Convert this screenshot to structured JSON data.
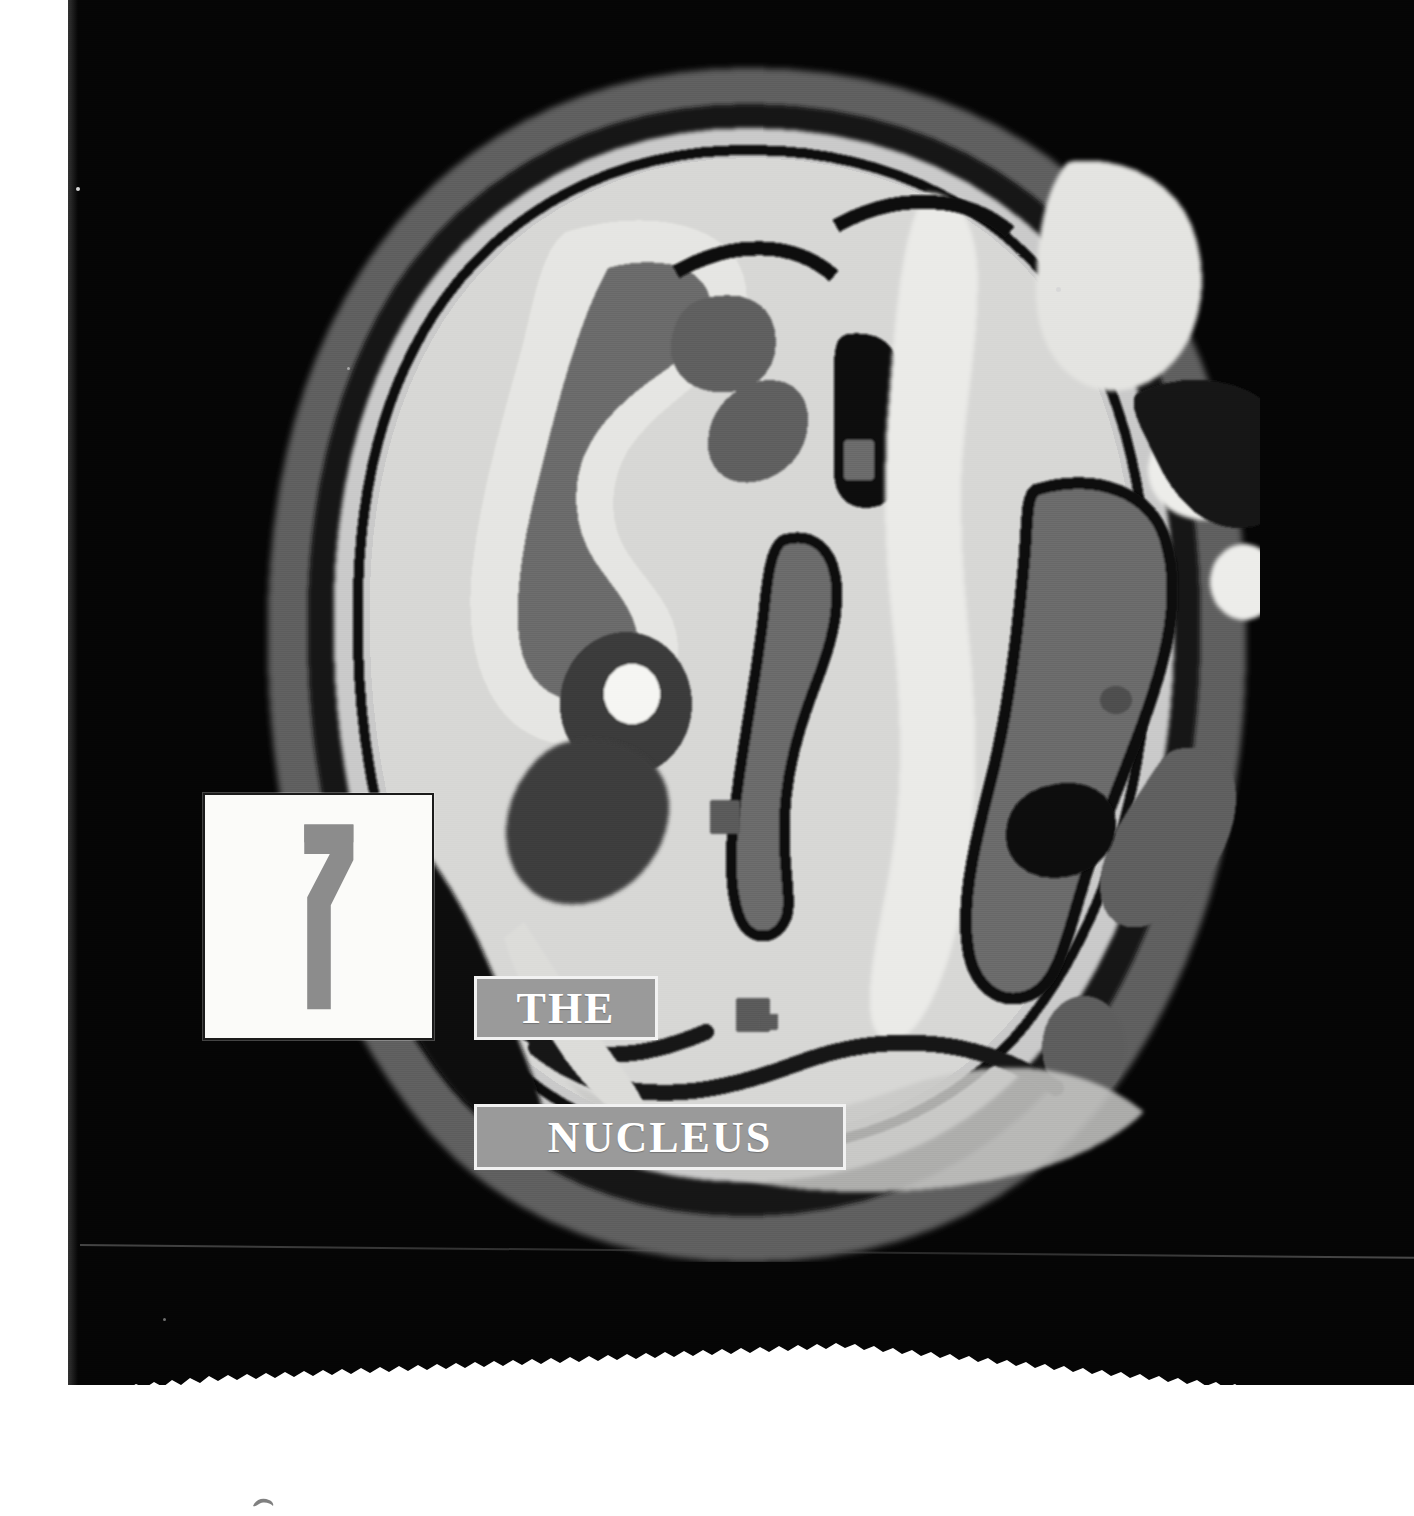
{
  "page": {
    "kind": "book-chapter-opener",
    "background_color": "#050505",
    "paper_color": "#ffffff",
    "left_margin_px": 68,
    "torn_bottom_edge": true
  },
  "chapter": {
    "number": "7",
    "number_plate": {
      "background_color": "#fbfbf9",
      "border_color": "#1b1b1b",
      "numeral_color": "#8c8c8c"
    },
    "title_lines": [
      {
        "text": "THE",
        "box_color": "#9a9a9a",
        "text_color": "#ffffff",
        "border_color": "#f2f2f2"
      },
      {
        "text": "NUCLEUS",
        "box_color": "#9a9a9a",
        "text_color": "#ffffff",
        "border_color": "#f2f2f2"
      }
    ],
    "full_title": "THE NUCLEUS"
  },
  "figure": {
    "name": "brain-scan-image",
    "icon": "brain-scan-icon",
    "palette": {
      "background": "#050505",
      "black": "#0a0a0a",
      "dark_gray": "#3b3b3b",
      "mid_gray": "#6e6e6e",
      "light_gray": "#a8a8a8",
      "pale": "#cfcfcf",
      "bright": "#e8e8e6",
      "white": "#f8f8f5"
    }
  },
  "marks": {
    "smudge_label": "ink-smudge",
    "speck_label": "dust-speck"
  }
}
